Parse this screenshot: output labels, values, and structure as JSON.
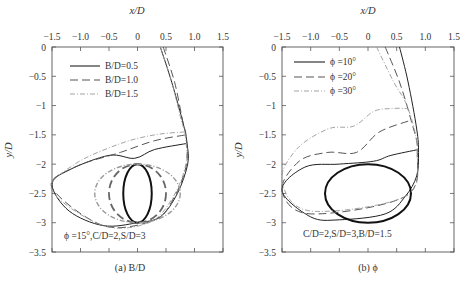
{
  "figure": {
    "panels": [
      {
        "id": "a",
        "caption": "(a) B/D",
        "xlabel": "x/D",
        "ylabel": "y/D",
        "annotation": "ϕ =15°,C/D=2,S/D=3",
        "legend": [
          "B/D=0.5",
          "B/D=1.0",
          "B/D=1.5"
        ]
      },
      {
        "id": "b",
        "caption": "(b) ϕ",
        "xlabel": "x/D",
        "ylabel": "y/D",
        "annotation": "C/D=2,S/D=3,B/D=1.5",
        "legend": [
          "ϕ =10°",
          "ϕ =20°",
          "ϕ =30°"
        ]
      }
    ],
    "xticks": [
      "−1.5",
      "−1.0",
      "−0.5",
      "0",
      "0.5",
      "1.0",
      "1.5"
    ],
    "yticks": [
      "0",
      "−0.5",
      "−1",
      "−1.5",
      "−2",
      "−2.5",
      "−3",
      "−3.5"
    ]
  },
  "chart_data": [
    {
      "type": "line",
      "title": "(a) B/D",
      "xlabel": "x/D",
      "ylabel": "y/D",
      "xlim": [
        -1.5,
        1.5
      ],
      "ylim": [
        -3.5,
        0
      ],
      "x_axis_position": "top",
      "grid": false,
      "legend_position": "upper left",
      "annotation": "ϕ =15°,C/D=2,S/D=3",
      "series": [
        {
          "name": "B/D=0.5",
          "style": "solid",
          "envelope": [
            [
              0.4,
              0
            ],
            [
              0.6,
              -0.6
            ],
            [
              0.8,
              -1.3
            ],
            [
              0.87,
              -1.65
            ],
            [
              0.88,
              -2.0
            ],
            [
              0.7,
              -2.5
            ],
            [
              0.4,
              -2.9
            ],
            [
              0.0,
              -3.0
            ],
            [
              -0.6,
              -3.05
            ],
            [
              -1.2,
              -2.8
            ],
            [
              -1.5,
              -2.35
            ],
            [
              -1.2,
              -2.1
            ],
            [
              -0.5,
              -1.85
            ],
            [
              -0.05,
              -1.9
            ],
            [
              0.3,
              -1.75
            ],
            [
              0.85,
              -1.65
            ]
          ],
          "obstacle_ellipse": {
            "cx": 0.0,
            "cy": -2.5,
            "rx": 0.25,
            "ry": 0.5
          }
        },
        {
          "name": "B/D=1.0",
          "style": "dashed",
          "envelope": [
            [
              0.45,
              0
            ],
            [
              0.65,
              -0.6
            ],
            [
              0.8,
              -1.3
            ],
            [
              0.85,
              -1.5
            ],
            [
              0.86,
              -2.0
            ],
            [
              0.65,
              -2.55
            ],
            [
              0.3,
              -2.95
            ],
            [
              -0.6,
              -3.05
            ],
            [
              -1.5,
              -2.4
            ],
            [
              -1.1,
              -2.05
            ],
            [
              -0.3,
              -1.8
            ],
            [
              0.3,
              -1.6
            ],
            [
              0.85,
              -1.5
            ]
          ],
          "obstacle_ellipse": {
            "cx": 0.0,
            "cy": -2.5,
            "rx": 0.5,
            "ry": 0.5
          }
        },
        {
          "name": "B/D=1.5",
          "style": "dash-dot",
          "envelope": [
            [
              0.4,
              0
            ],
            [
              0.6,
              -0.6
            ],
            [
              0.78,
              -1.3
            ],
            [
              0.83,
              -1.45
            ],
            [
              0.85,
              -2.0
            ],
            [
              0.6,
              -2.6
            ],
            [
              0.2,
              -3.0
            ],
            [
              -0.6,
              -3.05
            ],
            [
              -1.5,
              -2.45
            ],
            [
              -1.1,
              -2.0
            ],
            [
              -0.3,
              -1.65
            ],
            [
              0.3,
              -1.5
            ],
            [
              0.83,
              -1.45
            ]
          ],
          "obstacle_ellipse": {
            "cx": 0.0,
            "cy": -2.5,
            "rx": 0.75,
            "ry": 0.5
          }
        }
      ]
    },
    {
      "type": "line",
      "title": "(b) ϕ",
      "xlabel": "x/D",
      "ylabel": "y/D",
      "xlim": [
        -1.5,
        1.5
      ],
      "ylim": [
        -3.5,
        0
      ],
      "x_axis_position": "top",
      "grid": false,
      "legend_position": "upper left",
      "annotation": "C/D=2,S/D=3,B/D=1.5",
      "series": [
        {
          "name": "ϕ =10°",
          "style": "solid",
          "envelope": [
            [
              0.55,
              0
            ],
            [
              0.7,
              -0.6
            ],
            [
              0.85,
              -1.4
            ],
            [
              0.88,
              -1.8
            ],
            [
              0.85,
              -2.2
            ],
            [
              0.65,
              -2.55
            ],
            [
              0.3,
              -2.85
            ],
            [
              -0.5,
              -2.95
            ],
            [
              -1.0,
              -2.9
            ],
            [
              -1.5,
              -2.45
            ],
            [
              -1.1,
              -2.05
            ],
            [
              -0.5,
              -2.0
            ],
            [
              0.1,
              -1.95
            ],
            [
              0.4,
              -1.85
            ],
            [
              0.88,
              -1.75
            ]
          ],
          "obstacle_ellipse": {
            "cx": 0.0,
            "cy": -2.5,
            "rx": 0.75,
            "ry": 0.5
          }
        },
        {
          "name": "ϕ =20°",
          "style": "dashed",
          "envelope": [
            [
              0.3,
              0
            ],
            [
              0.55,
              -0.6
            ],
            [
              0.75,
              -1.25
            ],
            [
              0.86,
              -1.8
            ],
            [
              0.65,
              -2.55
            ],
            [
              -1.0,
              -2.85
            ],
            [
              -1.5,
              -2.45
            ],
            [
              -1.2,
              -1.95
            ],
            [
              -0.7,
              -1.8
            ],
            [
              -0.2,
              -1.8
            ],
            [
              0.2,
              -1.45
            ],
            [
              0.75,
              -1.25
            ]
          ],
          "obstacle_ellipse": {
            "cx": 0.0,
            "cy": -2.5,
            "rx": 0.75,
            "ry": 0.5
          }
        },
        {
          "name": "ϕ =30°",
          "style": "dash-dot",
          "envelope": [
            [
              0.15,
              0
            ],
            [
              0.45,
              -0.6
            ],
            [
              0.7,
              -1.05
            ],
            [
              0.86,
              -1.8
            ],
            [
              0.65,
              -2.55
            ],
            [
              -1.0,
              -2.8
            ],
            [
              -1.5,
              -2.3
            ],
            [
              -1.25,
              -1.75
            ],
            [
              -0.7,
              -1.4
            ],
            [
              -0.25,
              -1.35
            ],
            [
              0.1,
              -1.1
            ],
            [
              0.4,
              -1.05
            ],
            [
              0.7,
              -1.05
            ]
          ],
          "obstacle_ellipse": {
            "cx": 0.0,
            "cy": -2.5,
            "rx": 0.75,
            "ry": 0.5
          }
        }
      ]
    }
  ]
}
